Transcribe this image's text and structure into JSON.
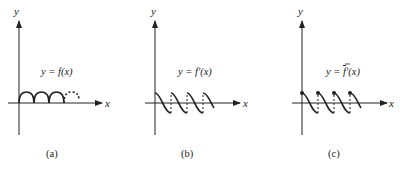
{
  "panels": [
    {
      "id": "a",
      "caption": "(a)",
      "equation": "y = f(x)",
      "y_axis_label": "y",
      "x_axis_label": "x",
      "description": "Periodic arches (rectified sine), last arch dashed"
    },
    {
      "id": "b",
      "caption": "(b)",
      "equation": "y = f′(x)",
      "y_axis_label": "y",
      "x_axis_label": "x",
      "description": "Derivative: descending S-shaped segments with dashed vertical jumps"
    },
    {
      "id": "c",
      "caption": "(c)",
      "equation_prefix": "y = ",
      "equation_f": "f",
      "equation_suffix": "′(x)",
      "equation": "y = f̄′(x)",
      "y_axis_label": "y",
      "x_axis_label": "x",
      "description": "Derivative with filled dots at left endpoints of each segment, dashed jumps"
    }
  ],
  "colors": {
    "ink": "#222222",
    "background": "#ffffff"
  }
}
